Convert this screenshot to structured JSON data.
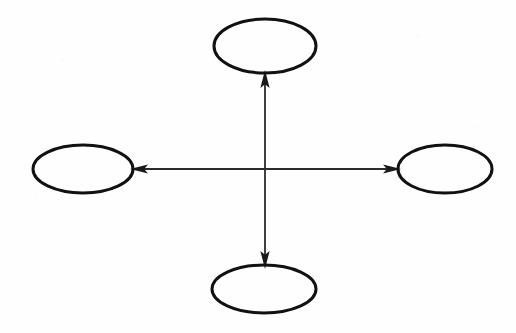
{
  "figure": {
    "background_color": "#fefefe",
    "stroke_color": "#111111",
    "arrow_color": "#2b2b2b",
    "node_stroke_width": 3,
    "arrow_stroke_width": 1.8,
    "nodes": [
      {
        "id": "top",
        "label": "",
        "name": "ellipse-node-top",
        "cx": 265,
        "cy": 46,
        "rx": 51,
        "ry": 27
      },
      {
        "id": "left",
        "label": "",
        "name": "ellipse-node-left",
        "cx": 83,
        "cy": 169,
        "rx": 50,
        "ry": 24
      },
      {
        "id": "right",
        "label": "",
        "name": "ellipse-node-right",
        "cx": 445,
        "cy": 169,
        "rx": 47,
        "ry": 24
      },
      {
        "id": "bottom",
        "label": "",
        "name": "ellipse-node-bottom",
        "cx": 264,
        "cy": 289,
        "rx": 52,
        "ry": 24
      }
    ],
    "connectors": [
      {
        "id": "vertical",
        "name": "vertical-double-arrow",
        "orientation": "vertical",
        "from": "bottom",
        "to": "top",
        "x1": 265,
        "y1": 265,
        "x2": 265,
        "y2": 74,
        "double_headed": true
      },
      {
        "id": "horizontal",
        "name": "horizontal-double-arrow",
        "orientation": "horizontal",
        "from": "right",
        "to": "left",
        "x1": 398,
        "y1": 169,
        "x2": 133,
        "y2": 169,
        "double_headed": true
      }
    ],
    "crossing_point": {
      "x": 265,
      "y": 169
    }
  }
}
